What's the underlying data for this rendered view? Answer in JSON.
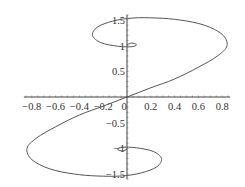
{
  "chart_data": {
    "type": "line",
    "title": "",
    "xlabel": "",
    "ylabel": "",
    "xlim": [
      -0.85,
      0.85
    ],
    "ylim": [
      -1.6,
      1.6
    ],
    "grid": false,
    "legend": null,
    "x_ticks": [
      "-0.8",
      "-0.6",
      "-0.4",
      "-0.2",
      "0",
      "0.2",
      "0.4",
      "0.6",
      "0.8"
    ],
    "x_tick_values": [
      -0.8,
      -0.6,
      -0.4,
      -0.2,
      0,
      0.2,
      0.4,
      0.6,
      0.8
    ],
    "y_ticks": [
      "-1.5",
      "-1",
      "-0.5",
      "0.5",
      "1",
      "1.5"
    ],
    "y_tick_values": [
      -1.5,
      -1,
      -0.5,
      0.5,
      1,
      1.5
    ],
    "series": [
      {
        "name": "parametric curve",
        "color": "#555555",
        "points": [
          [
            0.0,
            0.0
          ],
          [
            0.2,
            0.18
          ],
          [
            0.4,
            0.35
          ],
          [
            0.6,
            0.58
          ],
          [
            0.76,
            0.8
          ],
          [
            0.84,
            1.0
          ],
          [
            0.8,
            1.22
          ],
          [
            0.65,
            1.4
          ],
          [
            0.45,
            1.5
          ],
          [
            0.25,
            1.54
          ],
          [
            0.05,
            1.54
          ],
          [
            -0.12,
            1.48
          ],
          [
            -0.25,
            1.36
          ],
          [
            -0.29,
            1.2
          ],
          [
            -0.22,
            1.06
          ],
          [
            -0.08,
            0.99
          ],
          [
            0.04,
            0.98
          ],
          [
            0.08,
            1.02
          ],
          [
            0.04,
            1.05
          ],
          [
            0.0,
            1.02
          ]
        ],
        "symmetry": "point-symmetric about origin (second half mirrors first)"
      }
    ]
  }
}
